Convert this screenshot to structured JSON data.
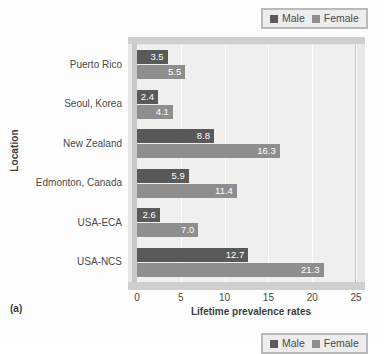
{
  "figure": {
    "label": "(a)",
    "y_axis_title": "Location",
    "x_axis_title": "Lifetime prevalence rates"
  },
  "legend": {
    "male_label": "Male",
    "female_label": "Female",
    "male_color": "#595959",
    "female_color": "#8e8e8e"
  },
  "chart_data": {
    "type": "bar",
    "orientation": "horizontal",
    "title": "",
    "subtitle": "",
    "xlabel": "Lifetime prevalence rates",
    "ylabel": "Location",
    "xlim": [
      0,
      25
    ],
    "xticks": [
      "0",
      "5",
      "10",
      "15",
      "20",
      "25"
    ],
    "grid": true,
    "legend_position": "top-right",
    "categories": [
      "Puerto Rico",
      "Seoul, Korea",
      "New Zealand",
      "Edmonton, Canada",
      "USA-ECA",
      "USA-NCS"
    ],
    "series": [
      {
        "name": "Male",
        "color": "#595959",
        "values": [
          3.5,
          2.4,
          8.8,
          5.9,
          2.6,
          12.7
        ],
        "labels": [
          "3.5",
          "2.4",
          "8.8",
          "5.9",
          "2.6",
          "12.7"
        ]
      },
      {
        "name": "Female",
        "color": "#8e8e8e",
        "values": [
          5.5,
          4.1,
          16.3,
          11.4,
          7.0,
          21.3
        ],
        "labels": [
          "5.5",
          "4.1",
          "16.3",
          "11.4",
          "7.0",
          "21.3"
        ]
      }
    ]
  }
}
